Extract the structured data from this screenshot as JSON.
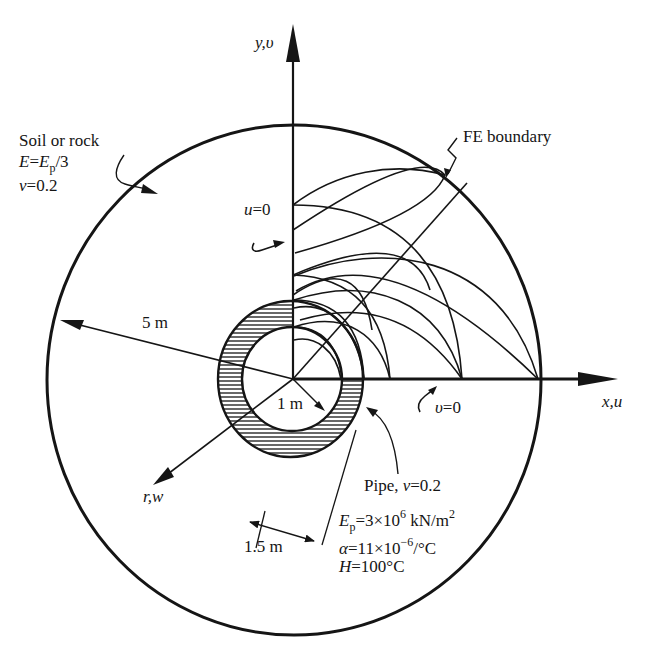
{
  "figure": {
    "axes": {
      "y_axis_label": "y,υ",
      "x_axis_label": "x,u",
      "r_axis_label": "r,w"
    },
    "soil": {
      "title": "Soil or rock",
      "E_lhs": "E",
      "E_eq": "=",
      "E_rhs": "E",
      "E_sub": "p",
      "E_tail": "/3",
      "nu_sym": "ν",
      "nu_val": "=0.2"
    },
    "fe_boundary_label": "FE boundary",
    "boundary_conditions": {
      "u_sym": "u",
      "u_val": "=0",
      "v_sym": "υ",
      "v_val": "=0"
    },
    "dimensions": {
      "outer_radius": "5 m",
      "inner_radius": "1 m",
      "pipe_outer_radius": "1.5 m"
    },
    "pipe": {
      "title": "Pipe, ",
      "nu_sym": "ν",
      "nu_val": "=0.2",
      "Ep_sym": "E",
      "Ep_sub": "p",
      "Ep_val": "=3×10",
      "Ep_exp": "6",
      "Ep_unit": " kN/m",
      "Ep_unit_exp": "2",
      "alpha_sym": "α",
      "alpha_val": "=11×10",
      "alpha_exp": "−6",
      "alpha_unit": "/°C",
      "H_sym": "H",
      "H_val": "=100°C"
    },
    "colors": {
      "ink": "#151515",
      "background": "#ffffff"
    }
  }
}
